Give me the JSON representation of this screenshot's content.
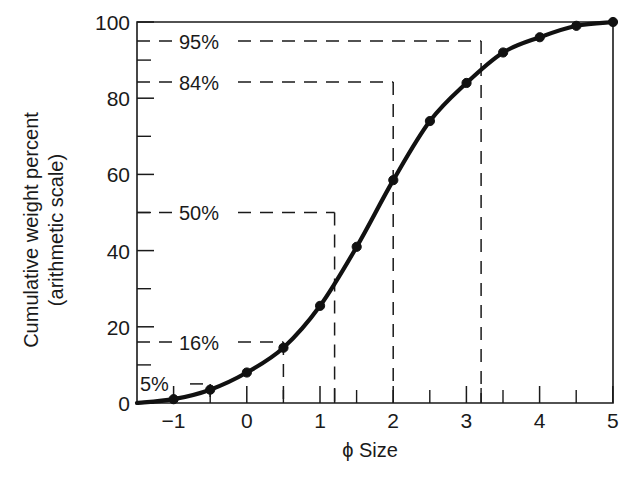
{
  "chart_data": {
    "type": "line",
    "title": "",
    "xlabel": "ϕ Size",
    "ylabel_line1": "Cumulative weight percent",
    "ylabel_line2": "(arithmetic scale)",
    "xlim": [
      -1.5,
      5
    ],
    "ylim": [
      0,
      100
    ],
    "grid": false,
    "legend": null,
    "x_major_ticks": [
      -1,
      0,
      1,
      2,
      3,
      4,
      5
    ],
    "x_major_tick_labels": [
      "−1",
      "0",
      "1",
      "2",
      "3",
      "4",
      "5"
    ],
    "x_minor_ticks": [
      -1.5,
      -0.5,
      0.5,
      1.5,
      2.5,
      3.5,
      4.5
    ],
    "x_extra_ticks": [
      1.7,
      3.7
    ],
    "y_major_ticks": [
      0,
      20,
      40,
      60,
      80,
      100
    ],
    "y_major_tick_labels": [
      "0",
      "20",
      "40",
      "60",
      "80",
      "100"
    ],
    "y_minor_ticks": [
      5,
      10,
      16,
      30,
      50,
      70,
      90,
      95
    ],
    "series": [
      {
        "name": "cumulative curve",
        "x": [
          -1.5,
          -1.0,
          -0.5,
          0.0,
          0.5,
          1.0,
          1.5,
          2.0,
          2.5,
          3.0,
          3.5,
          4.0,
          4.5,
          5.0
        ],
        "y": [
          0,
          1,
          3.5,
          8,
          14.5,
          25.5,
          41,
          58.5,
          74,
          84,
          92,
          96,
          99,
          100
        ]
      }
    ],
    "percentile_markers": [
      {
        "label": "95%",
        "y": 95,
        "x": 3.7
      },
      {
        "label": "84%",
        "y": 84,
        "x": 3.0
      },
      {
        "label": "50%",
        "y": 50,
        "x": 1.7
      },
      {
        "label": "16%",
        "y": 16,
        "x": 0.5
      },
      {
        "label": "5%",
        "y": 5,
        "x": -1.0
      }
    ]
  }
}
